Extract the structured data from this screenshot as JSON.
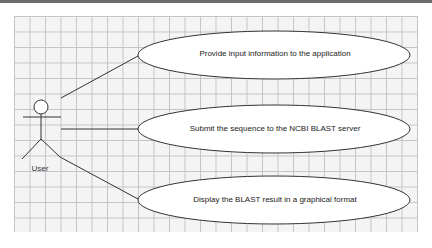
{
  "diagram": {
    "type": "use-case",
    "actor": {
      "label": "User"
    },
    "use_cases": [
      {
        "label": "Provide input information to the application"
      },
      {
        "label": "Submit the sequence to the NCBI BLAST server"
      },
      {
        "label": "Display the BLAST result in a graphical format"
      }
    ],
    "colors": {
      "grid_background": "#f4f4f4",
      "grid_lines": "#c4c4c4",
      "ellipse_fill": "#ffffff",
      "stroke": "#333333"
    }
  }
}
